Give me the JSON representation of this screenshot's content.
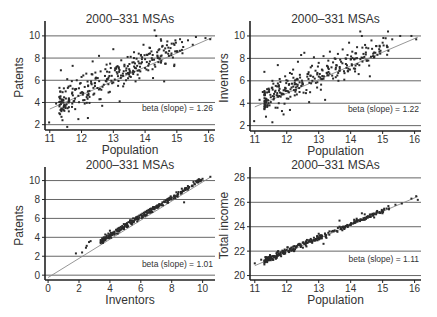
{
  "figure": {
    "background": "#ffffff",
    "gridline_color": "#555555",
    "axis_color": "#222222",
    "point_color": "#2a2a2a",
    "fit_line_color": "#8a8a8a"
  },
  "chart_data": [
    {
      "id": "patents-vs-population",
      "type": "scatter",
      "title": "2000–331 MSAs",
      "xlabel": "Population",
      "ylabel": "Patents",
      "xlim": [
        10.85,
        16.2
      ],
      "ylim": [
        1.7,
        10.8
      ],
      "xticks": [
        11,
        12,
        13,
        14,
        15,
        16
      ],
      "yticks": [
        2,
        4,
        6,
        8,
        10
      ],
      "grid": "horizontal",
      "annotation": "beta (slope) = 1.26",
      "fit": {
        "slope": 1.26,
        "intercept": -10.45,
        "x_range": [
          11.0,
          16.1
        ]
      },
      "frame": {
        "left": 45,
        "top": 27,
        "right": 215,
        "bottom": 128
      },
      "points": [
        [
          10.98,
          2.2
        ],
        [
          11.2,
          3.9
        ],
        [
          11.3,
          4.5
        ],
        [
          11.35,
          6.9
        ],
        [
          11.4,
          2.4
        ],
        [
          11.45,
          3.7
        ],
        [
          11.5,
          5.0
        ],
        [
          11.5,
          3.5
        ],
        [
          11.55,
          1.8
        ],
        [
          11.55,
          6.1
        ],
        [
          11.6,
          4.3
        ],
        [
          11.6,
          3.2
        ],
        [
          11.65,
          5.5
        ],
        [
          11.7,
          4.8
        ],
        [
          11.7,
          3.6
        ],
        [
          11.72,
          7.3
        ],
        [
          11.75,
          4.1
        ],
        [
          11.8,
          5.2
        ],
        [
          11.8,
          3.4
        ],
        [
          11.85,
          6.0
        ],
        [
          11.9,
          4.6
        ],
        [
          11.9,
          2.5
        ],
        [
          11.95,
          5.7
        ],
        [
          12.0,
          4.9
        ],
        [
          12.0,
          6.3
        ],
        [
          12.05,
          4.2
        ],
        [
          12.1,
          5.4
        ],
        [
          12.1,
          3.9
        ],
        [
          12.15,
          6.6
        ],
        [
          12.2,
          5.0
        ],
        [
          12.2,
          2.6
        ],
        [
          12.25,
          4.5
        ],
        [
          12.3,
          5.9
        ],
        [
          12.35,
          7.7
        ],
        [
          12.4,
          4.8
        ],
        [
          12.45,
          6.2
        ],
        [
          12.5,
          5.3
        ],
        [
          12.55,
          8.2
        ],
        [
          12.6,
          4.3
        ],
        [
          12.6,
          6.8
        ],
        [
          12.65,
          3.7
        ],
        [
          12.7,
          5.6
        ],
        [
          12.75,
          7.0
        ],
        [
          12.8,
          6.1
        ],
        [
          12.85,
          4.9
        ],
        [
          12.9,
          7.5
        ],
        [
          12.95,
          6.4
        ],
        [
          13.0,
          8.8
        ],
        [
          13.0,
          5.8
        ],
        [
          13.05,
          6.9
        ],
        [
          13.1,
          7.2
        ],
        [
          13.15,
          5.5
        ],
        [
          13.2,
          4.1
        ],
        [
          13.25,
          7.8
        ],
        [
          13.3,
          6.6
        ],
        [
          13.35,
          7.4
        ],
        [
          13.4,
          6.0
        ],
        [
          13.45,
          8.1
        ],
        [
          13.5,
          7.0
        ],
        [
          13.55,
          6.3
        ],
        [
          13.6,
          7.6
        ],
        [
          13.65,
          8.0
        ],
        [
          13.7,
          5.9
        ],
        [
          13.75,
          7.3
        ],
        [
          13.8,
          8.4
        ],
        [
          13.85,
          6.8
        ],
        [
          13.9,
          7.9
        ],
        [
          13.95,
          9.2
        ],
        [
          14.0,
          7.1
        ],
        [
          14.05,
          8.3
        ],
        [
          14.1,
          6.9
        ],
        [
          14.15,
          7.7
        ],
        [
          14.2,
          8.6
        ],
        [
          14.25,
          6.2
        ],
        [
          14.3,
          10.5
        ],
        [
          14.3,
          7.4
        ],
        [
          14.35,
          10.0
        ],
        [
          14.4,
          8.0
        ],
        [
          14.45,
          8.8
        ],
        [
          14.5,
          7.6
        ],
        [
          14.55,
          9.1
        ],
        [
          14.6,
          5.9
        ],
        [
          14.65,
          8.5
        ],
        [
          14.7,
          9.5
        ],
        [
          14.75,
          8.2
        ],
        [
          14.8,
          8.9
        ],
        [
          14.9,
          9.3
        ],
        [
          15.0,
          8.6
        ],
        [
          15.1,
          9.7
        ],
        [
          15.2,
          9.0
        ],
        [
          15.35,
          9.6
        ],
        [
          15.5,
          9.2
        ],
        [
          15.6,
          9.9
        ],
        [
          15.9,
          9.8
        ],
        [
          16.05,
          9.7
        ]
      ]
    },
    {
      "id": "inventors-vs-population",
      "type": "scatter",
      "title": "2000–331 MSAs",
      "xlabel": "Population",
      "ylabel": "Inventors",
      "xlim": [
        10.85,
        16.2
      ],
      "ylim": [
        1.7,
        10.8
      ],
      "xticks": [
        11,
        12,
        13,
        14,
        15,
        16
      ],
      "yticks": [
        2,
        4,
        6,
        8,
        10
      ],
      "grid": "horizontal",
      "annotation": "beta (slope) = 1.22",
      "fit": {
        "slope": 1.22,
        "intercept": -9.75,
        "x_range": [
          11.0,
          16.1
        ]
      },
      "frame": {
        "left": 250,
        "top": 27,
        "right": 421,
        "bottom": 129
      },
      "points": [
        [
          10.98,
          2.4
        ],
        [
          11.15,
          4.3
        ],
        [
          11.25,
          5.0
        ],
        [
          11.3,
          6.8
        ],
        [
          11.35,
          2.8
        ],
        [
          11.4,
          3.8
        ],
        [
          11.45,
          5.2
        ],
        [
          11.5,
          4.1
        ],
        [
          11.55,
          2.3
        ],
        [
          11.55,
          6.0
        ],
        [
          11.6,
          4.6
        ],
        [
          11.65,
          3.6
        ],
        [
          11.7,
          5.5
        ],
        [
          11.72,
          7.4
        ],
        [
          11.75,
          4.0
        ],
        [
          11.8,
          5.9
        ],
        [
          11.85,
          3.3
        ],
        [
          11.9,
          4.8
        ],
        [
          11.9,
          3.0
        ],
        [
          11.95,
          6.4
        ],
        [
          12.0,
          5.1
        ],
        [
          12.05,
          4.4
        ],
        [
          12.1,
          6.7
        ],
        [
          12.1,
          3.4
        ],
        [
          12.15,
          5.4
        ],
        [
          12.2,
          7.0
        ],
        [
          12.25,
          4.7
        ],
        [
          12.3,
          6.1
        ],
        [
          12.35,
          7.7
        ],
        [
          12.4,
          5.0
        ],
        [
          12.45,
          8.3
        ],
        [
          12.5,
          5.7
        ],
        [
          12.55,
          8.5
        ],
        [
          12.6,
          4.9
        ],
        [
          12.65,
          6.6
        ],
        [
          12.7,
          4.1
        ],
        [
          12.75,
          7.2
        ],
        [
          12.8,
          6.0
        ],
        [
          12.85,
          8.1
        ],
        [
          12.9,
          6.9
        ],
        [
          12.95,
          5.4
        ],
        [
          13.0,
          7.6
        ],
        [
          13.05,
          6.3
        ],
        [
          13.1,
          7.0
        ],
        [
          13.15,
          8.2
        ],
        [
          13.2,
          4.3
        ],
        [
          13.25,
          6.7
        ],
        [
          13.3,
          7.8
        ],
        [
          13.35,
          8.6
        ],
        [
          13.4,
          7.2
        ],
        [
          13.45,
          6.2
        ],
        [
          13.5,
          8.0
        ],
        [
          13.55,
          7.4
        ],
        [
          13.6,
          8.4
        ],
        [
          13.65,
          6.9
        ],
        [
          13.7,
          7.7
        ],
        [
          13.75,
          8.8
        ],
        [
          13.8,
          6.1
        ],
        [
          13.85,
          7.5
        ],
        [
          13.9,
          8.3
        ],
        [
          13.95,
          9.4
        ],
        [
          14.0,
          7.9
        ],
        [
          14.05,
          8.6
        ],
        [
          14.1,
          7.1
        ],
        [
          14.15,
          8.0
        ],
        [
          14.2,
          9.0
        ],
        [
          14.25,
          6.6
        ],
        [
          14.3,
          10.4
        ],
        [
          14.35,
          10.0
        ],
        [
          14.4,
          8.4
        ],
        [
          14.45,
          9.2
        ],
        [
          14.5,
          7.8
        ],
        [
          14.55,
          8.9
        ],
        [
          14.6,
          6.4
        ],
        [
          14.65,
          9.6
        ],
        [
          14.7,
          8.2
        ],
        [
          14.8,
          9.1
        ],
        [
          14.9,
          8.6
        ],
        [
          15.0,
          9.4
        ],
        [
          15.15,
          9.0
        ],
        [
          15.3,
          9.7
        ],
        [
          15.55,
          10.0
        ],
        [
          15.9,
          10.0
        ],
        [
          16.05,
          9.7
        ]
      ]
    },
    {
      "id": "patents-vs-inventors",
      "type": "scatter",
      "title": "2000–331 MSAs",
      "xlabel": "Inventors",
      "ylabel": "Patents",
      "xlim": [
        -0.2,
        10.8
      ],
      "ylim": [
        -0.3,
        10.8
      ],
      "xticks": [
        0,
        2,
        4,
        6,
        8,
        10
      ],
      "yticks": [
        0,
        2,
        4,
        6,
        8,
        10
      ],
      "grid": "horizontal",
      "annotation": "beta (slope) = 1.01",
      "fit": {
        "slope": 1.01,
        "intercept": -0.25,
        "x_range": [
          0.0,
          10.5
        ]
      },
      "frame": {
        "left": 45,
        "top": 173,
        "right": 215,
        "bottom": 278
      },
      "points": [
        [
          1.8,
          2.3
        ],
        [
          2.2,
          2.4
        ],
        [
          2.45,
          2.9
        ],
        [
          2.5,
          3.1
        ],
        [
          2.65,
          3.5
        ],
        [
          2.75,
          3.6
        ],
        [
          3.4,
          3.7
        ],
        [
          3.5,
          3.9
        ],
        [
          3.6,
          4.0
        ],
        [
          3.7,
          4.3
        ],
        [
          3.8,
          4.2
        ],
        [
          3.9,
          4.4
        ],
        [
          4.0,
          4.7
        ],
        [
          4.0,
          4.1
        ],
        [
          4.1,
          4.3
        ],
        [
          4.2,
          4.5
        ],
        [
          4.3,
          4.6
        ],
        [
          4.4,
          4.8
        ],
        [
          4.5,
          4.9
        ],
        [
          4.6,
          5.0
        ],
        [
          4.7,
          5.1
        ],
        [
          4.8,
          5.2
        ],
        [
          4.9,
          5.4
        ],
        [
          5.0,
          5.4
        ],
        [
          5.1,
          5.5
        ],
        [
          5.2,
          5.6
        ],
        [
          5.3,
          5.8
        ],
        [
          5.4,
          5.8
        ],
        [
          5.5,
          6.0
        ],
        [
          5.6,
          6.0
        ],
        [
          5.7,
          6.1
        ],
        [
          5.8,
          6.2
        ],
        [
          5.9,
          6.3
        ],
        [
          6.0,
          6.4
        ],
        [
          6.1,
          6.5
        ],
        [
          6.2,
          6.6
        ],
        [
          6.3,
          6.7
        ],
        [
          6.4,
          6.8
        ],
        [
          6.5,
          6.9
        ],
        [
          6.6,
          7.0
        ],
        [
          6.7,
          7.0
        ],
        [
          6.8,
          7.2
        ],
        [
          6.9,
          7.2
        ],
        [
          7.0,
          7.3
        ],
        [
          7.2,
          7.5
        ],
        [
          7.4,
          7.7
        ],
        [
          7.6,
          7.9
        ],
        [
          7.8,
          8.1
        ],
        [
          8.0,
          8.2
        ],
        [
          8.2,
          8.4
        ],
        [
          8.4,
          8.6
        ],
        [
          8.6,
          8.8
        ],
        [
          8.8,
          7.7
        ],
        [
          8.9,
          9.0
        ],
        [
          9.1,
          9.2
        ],
        [
          9.3,
          9.4
        ],
        [
          9.5,
          9.6
        ],
        [
          9.7,
          9.8
        ],
        [
          9.9,
          10.0
        ],
        [
          10.5,
          10.4
        ]
      ]
    },
    {
      "id": "total-income-vs-population",
      "type": "scatter",
      "title": "2000–331 MSAs",
      "xlabel": "Population",
      "ylabel": "Total income",
      "xlim": [
        10.85,
        16.2
      ],
      "ylim": [
        19.8,
        28.4
      ],
      "xticks": [
        11,
        12,
        13,
        14,
        15,
        16
      ],
      "yticks": [
        20,
        22,
        24,
        26,
        28
      ],
      "grid": "horizontal",
      "annotation": "beta (slope) = 1.11",
      "fit": {
        "slope": 1.11,
        "intercept": 8.6,
        "x_range": [
          11.0,
          16.1
        ]
      },
      "frame": {
        "left": 250,
        "top": 173,
        "right": 421,
        "bottom": 278
      },
      "points": [
        [
          11.0,
          21.0
        ],
        [
          11.2,
          21.3
        ],
        [
          11.4,
          21.4
        ],
        [
          11.5,
          21.5
        ],
        [
          11.6,
          21.6
        ],
        [
          11.7,
          21.7
        ],
        [
          11.75,
          21.8
        ],
        [
          11.8,
          21.9
        ],
        [
          11.9,
          22.0
        ],
        [
          11.95,
          21.8
        ],
        [
          12.0,
          22.1
        ],
        [
          12.05,
          22.0
        ],
        [
          12.1,
          22.2
        ],
        [
          12.15,
          22.3
        ],
        [
          12.2,
          22.1
        ],
        [
          12.25,
          22.4
        ],
        [
          12.3,
          22.3
        ],
        [
          12.35,
          22.5
        ],
        [
          12.4,
          22.6
        ],
        [
          12.45,
          22.4
        ],
        [
          12.5,
          22.7
        ],
        [
          12.55,
          22.6
        ],
        [
          12.6,
          22.8
        ],
        [
          12.65,
          22.7
        ],
        [
          12.7,
          22.9
        ],
        [
          12.75,
          23.0
        ],
        [
          12.8,
          22.8
        ],
        [
          12.85,
          23.1
        ],
        [
          12.9,
          23.0
        ],
        [
          12.95,
          23.2
        ],
        [
          13.0,
          23.1
        ],
        [
          13.05,
          23.3
        ],
        [
          13.1,
          23.2
        ],
        [
          13.15,
          22.6
        ],
        [
          13.2,
          23.4
        ],
        [
          13.3,
          23.5
        ],
        [
          13.4,
          23.6
        ],
        [
          13.5,
          23.7
        ],
        [
          13.6,
          23.9
        ],
        [
          13.65,
          24.5
        ],
        [
          13.7,
          23.8
        ],
        [
          13.8,
          24.0
        ],
        [
          13.9,
          24.1
        ],
        [
          14.0,
          24.2
        ],
        [
          14.1,
          24.3
        ],
        [
          14.2,
          24.5
        ],
        [
          14.3,
          24.6
        ],
        [
          14.35,
          25.1
        ],
        [
          14.4,
          24.7
        ],
        [
          14.5,
          24.8
        ],
        [
          14.6,
          25.0
        ],
        [
          14.7,
          24.9
        ],
        [
          14.8,
          25.1
        ],
        [
          14.9,
          25.2
        ],
        [
          15.0,
          25.3
        ],
        [
          15.2,
          25.5
        ],
        [
          15.4,
          25.8
        ],
        [
          15.6,
          25.9
        ],
        [
          15.9,
          26.3
        ],
        [
          16.05,
          26.5
        ],
        [
          16.1,
          26.2
        ]
      ]
    }
  ]
}
